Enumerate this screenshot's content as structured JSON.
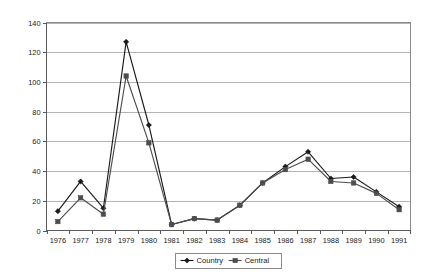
{
  "chart_data": {
    "type": "line",
    "title": "",
    "subtitle": "",
    "xlabel": "",
    "ylabel": "",
    "categories": [
      "1976",
      "1977",
      "1978",
      "1979",
      "1980",
      "1981",
      "1982",
      "1983",
      "1984",
      "1985",
      "1986",
      "1987",
      "1988",
      "1989",
      "1990",
      "1991"
    ],
    "x": [
      1976,
      1977,
      1978,
      1979,
      1980,
      1981,
      1982,
      1983,
      1984,
      1985,
      1986,
      1987,
      1988,
      1989,
      1990,
      1991
    ],
    "series": [
      {
        "name": "Country",
        "marker": "diamond",
        "color": "#1a1a1a",
        "values": [
          13,
          33,
          15,
          127,
          71,
          4,
          8,
          7,
          17,
          32,
          43,
          53,
          35,
          36,
          26,
          16
        ]
      },
      {
        "name": "Central",
        "marker": "square",
        "color": "#4d4d4d",
        "values": [
          6,
          22,
          11,
          104,
          59,
          4,
          8,
          7,
          17,
          32,
          41,
          48,
          33,
          32,
          25,
          14
        ]
      }
    ],
    "ylim": [
      0,
      140
    ],
    "ytick_step": 20,
    "yticks": [
      0,
      20,
      40,
      60,
      80,
      100,
      120,
      140
    ],
    "ytick_labels": [
      "0",
      "20",
      "40",
      "60",
      "80",
      "100",
      "120",
      "140"
    ],
    "grid": true,
    "grid_axis": "y",
    "legend_position": "bottom-center",
    "legend_entries": [
      "Country",
      "Central"
    ]
  },
  "colors": {
    "background": "#ffffff",
    "gridline": "#b4b4b4",
    "frame": "#8a8a8a",
    "axis": "#5a5a5a",
    "text": "#1a1a1a",
    "series_country": "#1a1a1a",
    "series_central": "#4d4d4d"
  },
  "legend": {
    "items": [
      {
        "label": "Country",
        "marker": "diamond",
        "color": "#1a1a1a"
      },
      {
        "label": "Central",
        "marker": "square",
        "color": "#4d4d4d"
      }
    ]
  }
}
